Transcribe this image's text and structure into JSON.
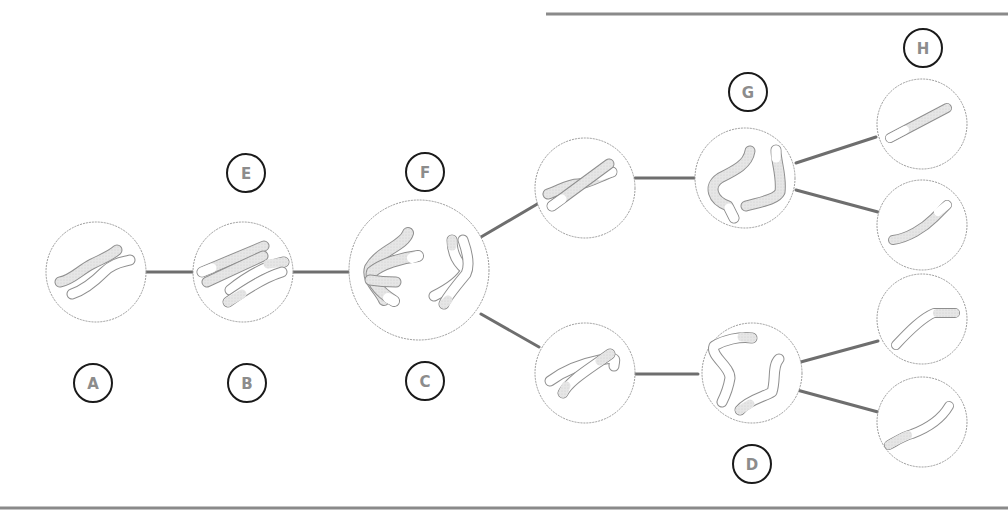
{
  "diagram": {
    "type": "meiosis chromosome stages",
    "colors": {
      "rule": "#8a8a8a",
      "connector": "#6e6e6e",
      "cell_outline": "#9a9a9a",
      "chromosome_outline": "#8f8f8f",
      "chromosome_shaded": "#e4e4e4",
      "chromosome_white": "#ffffff",
      "label_ring": "#1a1a1a",
      "label_text": "#8c8c8c"
    },
    "labels": [
      {
        "id": "A",
        "text": "A"
      },
      {
        "id": "B",
        "text": "B"
      },
      {
        "id": "C",
        "text": "C"
      },
      {
        "id": "D",
        "text": "D"
      },
      {
        "id": "E",
        "text": "E"
      },
      {
        "id": "F",
        "text": "F"
      },
      {
        "id": "G",
        "text": "G"
      },
      {
        "id": "H",
        "text": "H"
      }
    ],
    "cells": [
      {
        "id": "cell-1",
        "description": "two homologous chromosomes, unpaired"
      },
      {
        "id": "cell-2",
        "description": "replicated homologs pairing (synapsis)"
      },
      {
        "id": "cell-3",
        "description": "homologs separating, large cell"
      },
      {
        "id": "cell-4",
        "description": "upper daughter cell, crossed chromatids"
      },
      {
        "id": "cell-5",
        "description": "lower daughter cell, crossed chromatids"
      },
      {
        "id": "cell-6",
        "description": "upper cell, chromatids separating"
      },
      {
        "id": "cell-7",
        "description": "lower cell, chromatids separating"
      },
      {
        "id": "cell-8",
        "description": "gamete 1"
      },
      {
        "id": "cell-9",
        "description": "gamete 2"
      },
      {
        "id": "cell-10",
        "description": "gamete 3"
      },
      {
        "id": "cell-11",
        "description": "gamete 4"
      }
    ]
  }
}
